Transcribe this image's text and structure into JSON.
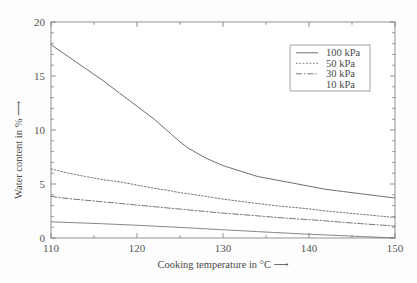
{
  "chart_data": {
    "type": "line",
    "title": "",
    "xlabel": "Cooking temperature in °C",
    "ylabel": "Water content in %",
    "xlabel_arrow": "⟶",
    "ylabel_arrow": "⟶",
    "xlim": [
      110,
      150
    ],
    "ylim": [
      0,
      20
    ],
    "x_ticks": [
      110,
      120,
      130,
      140,
      150
    ],
    "x_tick_labels": [
      "110",
      "120",
      "130",
      "140",
      "150"
    ],
    "x_minor_step": 5,
    "y_ticks": [
      0,
      5,
      10,
      15,
      20
    ],
    "y_tick_labels": [
      "0",
      "5",
      "10",
      "15",
      "20"
    ],
    "y_minor_step": 1,
    "grid": false,
    "legend_position": "upper-right",
    "line_color": "#6f6f6f",
    "axis_color": "#777777",
    "background": "#fdfdfd",
    "x": [
      110,
      112,
      114,
      116,
      118,
      120,
      122,
      124,
      125,
      126,
      128,
      130,
      132,
      134,
      136,
      138,
      140,
      142,
      144,
      146,
      148,
      150
    ],
    "series": [
      {
        "name": "100 kPa",
        "label": "100 kPa",
        "style": "solid",
        "values": [
          17.9,
          16.8,
          15.7,
          14.6,
          13.4,
          12.2,
          11.0,
          9.6,
          8.9,
          8.3,
          7.4,
          6.7,
          6.2,
          5.7,
          5.4,
          5.1,
          4.8,
          4.5,
          4.3,
          4.1,
          3.9,
          3.7
        ]
      },
      {
        "name": "50 kPa",
        "label": "50 kPa",
        "style": "dotted",
        "values": [
          6.4,
          6.0,
          5.7,
          5.4,
          5.2,
          4.9,
          4.6,
          4.35,
          4.2,
          4.1,
          3.85,
          3.6,
          3.4,
          3.2,
          3.0,
          2.85,
          2.7,
          2.5,
          2.35,
          2.2,
          2.05,
          1.9
        ]
      },
      {
        "name": "30 kPa",
        "label": "30 kPa",
        "style": "dash-dot",
        "values": [
          3.85,
          3.65,
          3.5,
          3.35,
          3.2,
          3.05,
          2.9,
          2.75,
          2.68,
          2.6,
          2.45,
          2.3,
          2.18,
          2.05,
          1.92,
          1.8,
          1.7,
          1.58,
          1.45,
          1.33,
          1.22,
          1.1
        ]
      },
      {
        "name": "10 kPa",
        "label": "10 kPa",
        "style": "solid-thin",
        "values": [
          1.5,
          1.44,
          1.38,
          1.32,
          1.25,
          1.18,
          1.1,
          1.02,
          0.98,
          0.94,
          0.85,
          0.76,
          0.68,
          0.59,
          0.51,
          0.43,
          0.35,
          0.28,
          0.21,
          0.14,
          0.07,
          0.0
        ]
      }
    ]
  },
  "legend": {
    "entries": [
      {
        "label": "100 kPa",
        "style": "solid"
      },
      {
        "label": "50 kPa",
        "style": "dotted"
      },
      {
        "label": "30 kPa",
        "style": "dash-dot"
      },
      {
        "label": "10 kPa",
        "style": "none"
      }
    ]
  },
  "axes": {
    "x_title": "Cooking temperature in °C",
    "y_title": "Water content in %",
    "arrow": "⟶"
  }
}
